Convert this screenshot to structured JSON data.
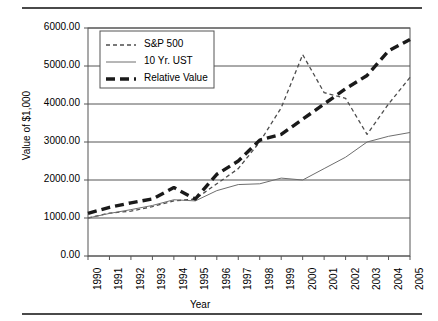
{
  "chart_data": {
    "type": "line",
    "title": "",
    "xlabel": "Year",
    "ylabel": "Value of $1,000",
    "xlim": [
      1990,
      2005
    ],
    "ylim": [
      0,
      6000
    ],
    "grid": true,
    "legend_position": "top-left-inside",
    "x": [
      1990,
      1991,
      1992,
      1993,
      1994,
      1995,
      1996,
      1997,
      1998,
      1999,
      2000,
      2001,
      2002,
      2003,
      2004,
      2005
    ],
    "xtick_labels": [
      "1990",
      "1991",
      "1992",
      "1993",
      "1994",
      "1995",
      "1996",
      "1997",
      "1998",
      "1999",
      "2000",
      "2001",
      "2002",
      "2003",
      "2004",
      "2005"
    ],
    "ytick_labels": [
      "0.00",
      "1000.00",
      "2000.00",
      "3000.00",
      "4000.00",
      "5000.00",
      "6000.00"
    ],
    "ytick_values": [
      0,
      1000,
      2000,
      3000,
      4000,
      5000,
      6000
    ],
    "series": [
      {
        "name": "S&P 500",
        "style": "short-dashed",
        "color": "#4d4d4d",
        "width": 1.3,
        "values": [
          1000,
          1130,
          1180,
          1300,
          1450,
          1500,
          1900,
          2300,
          3000,
          3900,
          5300,
          4300,
          4150,
          3200,
          4000,
          4700
        ]
      },
      {
        "name": "10 Yr. UST",
        "style": "solid",
        "color": "#6e6e6e",
        "width": 1.0,
        "values": [
          1000,
          1120,
          1220,
          1330,
          1480,
          1450,
          1720,
          1880,
          1900,
          2050,
          2000,
          2300,
          2600,
          3000,
          3150,
          3250
        ]
      },
      {
        "name": "Relative Value",
        "style": "long-dashed",
        "color": "#1a1a1a",
        "width": 3.4,
        "values": [
          1120,
          1280,
          1400,
          1500,
          1800,
          1500,
          2150,
          2500,
          3050,
          3200,
          3600,
          4000,
          4400,
          4750,
          5400,
          5700
        ]
      }
    ]
  },
  "legend": {
    "items": [
      {
        "label": "S&P 500"
      },
      {
        "label": "10 Yr. UST"
      },
      {
        "label": "Relative Value"
      }
    ]
  }
}
